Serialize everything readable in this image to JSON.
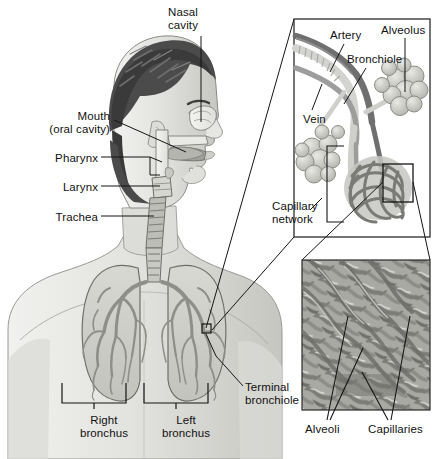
{
  "figure": {
    "background_color": "#ffffff",
    "width": 447,
    "height": 459
  },
  "palette": {
    "outline": "#1a1a1a",
    "label_text": "#111111",
    "skin_light": "#e4e4e2",
    "skin_mid": "#d2d2ce",
    "skin_shadow": "#bcbcb8",
    "hair_dark": "#4b4b4b",
    "hair_darkest": "#363636",
    "airway_light": "#ededea",
    "lung_fill": "#cfcfca",
    "bronchial_tree": "#9a9a94",
    "artery_dark": "#6f6f6f",
    "vein_mid": "#9d9d9d",
    "alveoli_light": "#d6d6d2",
    "alveoli_mid": "#b8b8b2",
    "capillary_dark": "#7a7a76",
    "capillary_field": "#a9a9a4",
    "inset_border": "#2b2b2b"
  },
  "main_panel": {
    "name": "torso-anatomy-view",
    "labels": [
      {
        "id": "nasal-cavity",
        "text": "Nasal\ncavity",
        "x": 168,
        "y": 6,
        "align": "left"
      },
      {
        "id": "mouth-oral-cavity",
        "text": "Mouth\n(oral cavity)",
        "x": 110,
        "y": 110,
        "align": "right"
      },
      {
        "id": "pharynx",
        "text": "Pharynx",
        "x": 98,
        "y": 152,
        "align": "right"
      },
      {
        "id": "larynx",
        "text": "Larynx",
        "x": 98,
        "y": 181,
        "align": "right"
      },
      {
        "id": "trachea",
        "text": "Trachea",
        "x": 98,
        "y": 211,
        "align": "right"
      },
      {
        "id": "right-bronchus",
        "text": "Right\nbronchus",
        "x": 104,
        "y": 414,
        "align": "center"
      },
      {
        "id": "left-bronchus",
        "text": "Left\nbronchus",
        "x": 186,
        "y": 414,
        "align": "center"
      },
      {
        "id": "terminal-bronchiole",
        "text": "Terminal\nbronchiole",
        "x": 245,
        "y": 381,
        "align": "left"
      }
    ]
  },
  "upper_inset": {
    "name": "bronchiole-alveolus-inset",
    "box": {
      "x": 294,
      "y": 19,
      "width": 136,
      "height": 218
    },
    "labels": [
      {
        "id": "artery",
        "text": "Artery",
        "x": 330,
        "y": 29,
        "align": "left"
      },
      {
        "id": "alveolus",
        "text": "Alveolus",
        "x": 383,
        "y": 24,
        "align": "left"
      },
      {
        "id": "bronchiole",
        "text": "Bronchiole",
        "x": 349,
        "y": 53,
        "align": "left"
      },
      {
        "id": "vein",
        "text": "Vein",
        "x": 304,
        "y": 113,
        "align": "left"
      },
      {
        "id": "capillary-network",
        "text": "Capillary\nnetwork",
        "x": 298,
        "y": 200,
        "align": "left"
      }
    ]
  },
  "lower_inset": {
    "name": "capillary-bed-inset",
    "box": {
      "x": 302,
      "y": 260,
      "width": 128,
      "height": 150
    },
    "labels": [
      {
        "id": "alveoli",
        "text": "Alveoli",
        "x": 305,
        "y": 424,
        "align": "left"
      },
      {
        "id": "capillaries",
        "text": "Capillaries",
        "x": 370,
        "y": 424,
        "align": "left"
      }
    ]
  }
}
